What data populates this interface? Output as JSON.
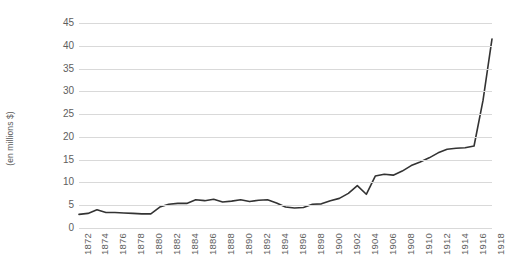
{
  "chart_data": {
    "type": "line",
    "title": "",
    "subtitle": "",
    "xlabel": "",
    "ylabel": "(en millions $)",
    "ylim": [
      0,
      45
    ],
    "xlim": [
      1872,
      1918
    ],
    "y_ticks": [
      0,
      5,
      10,
      15,
      20,
      25,
      30,
      35,
      40,
      45
    ],
    "x_ticks": [
      1872,
      1874,
      1876,
      1878,
      1880,
      1882,
      1884,
      1886,
      1888,
      1890,
      1892,
      1894,
      1896,
      1898,
      1900,
      1902,
      1904,
      1906,
      1908,
      1910,
      1912,
      1914,
      1916,
      1918
    ],
    "grid": true,
    "grid_axis": "y",
    "legend": false,
    "legend_position": "none",
    "line_color": "#333333",
    "grid_color": "#d9d9d9",
    "tick_label_color": "#5e5e5e",
    "x": [
      1872,
      1873,
      1874,
      1875,
      1876,
      1877,
      1878,
      1879,
      1880,
      1881,
      1882,
      1883,
      1884,
      1885,
      1886,
      1887,
      1888,
      1889,
      1890,
      1891,
      1892,
      1893,
      1894,
      1895,
      1896,
      1897,
      1898,
      1899,
      1900,
      1901,
      1902,
      1903,
      1904,
      1905,
      1906,
      1907,
      1908,
      1909,
      1910,
      1911,
      1912,
      1913,
      1914,
      1915,
      1916,
      1917,
      1918
    ],
    "values": [
      3.0,
      3.2,
      4.0,
      3.4,
      3.4,
      3.3,
      3.2,
      3.1,
      3.1,
      4.6,
      5.2,
      5.4,
      5.4,
      6.2,
      6.0,
      6.3,
      5.7,
      5.9,
      6.2,
      5.8,
      6.1,
      6.2,
      5.5,
      4.6,
      4.4,
      4.5,
      5.2,
      5.3,
      6.0,
      6.5,
      7.6,
      9.3,
      7.4,
      11.4,
      11.8,
      11.6,
      12.5,
      13.7,
      14.5,
      15.4,
      16.5,
      17.3,
      17.5,
      17.6,
      18.0,
      28.0,
      41.5
    ],
    "series": [
      {
        "name": "",
        "values": [
          3.0,
          3.2,
          4.0,
          3.4,
          3.4,
          3.3,
          3.2,
          3.1,
          3.1,
          4.6,
          5.2,
          5.4,
          5.4,
          6.2,
          6.0,
          6.3,
          5.7,
          5.9,
          6.2,
          5.8,
          6.1,
          6.2,
          5.5,
          4.6,
          4.4,
          4.5,
          5.2,
          5.3,
          6.0,
          6.5,
          7.6,
          9.3,
          7.4,
          11.4,
          11.8,
          11.6,
          12.5,
          13.7,
          14.5,
          15.4,
          16.5,
          17.3,
          17.5,
          17.6,
          18.0,
          28.0,
          41.5
        ]
      }
    ]
  }
}
